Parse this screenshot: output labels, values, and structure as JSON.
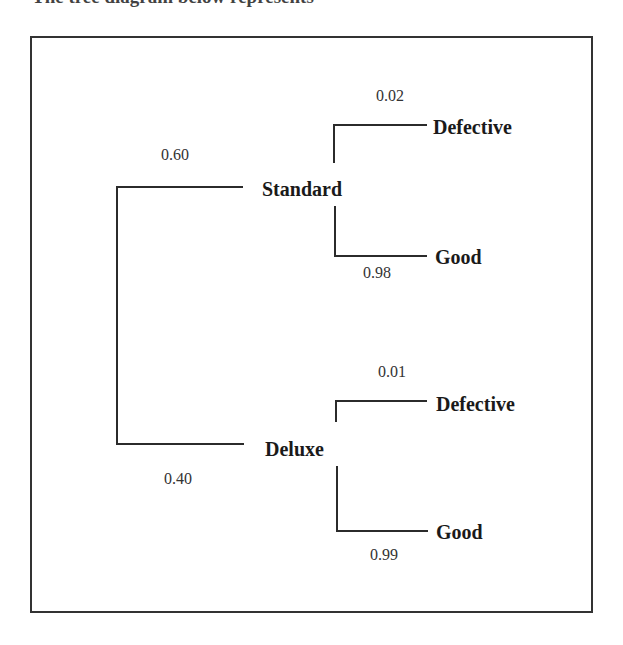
{
  "heading": {
    "text": "The tree diagram below represents"
  },
  "tree": {
    "root_branches": [
      {
        "label": "Standard",
        "probability": "0.60",
        "children": [
          {
            "label": "Defective",
            "probability": "0.02"
          },
          {
            "label": "Good",
            "probability": "0.98"
          }
        ]
      },
      {
        "label": "Deluxe",
        "probability": "0.40",
        "children": [
          {
            "label": "Defective",
            "probability": "0.01"
          },
          {
            "label": "Good",
            "probability": "0.99"
          }
        ]
      }
    ]
  },
  "colors": {
    "line": "#2b2b2b",
    "frame": "#333333",
    "text": "#1a1a1a"
  }
}
